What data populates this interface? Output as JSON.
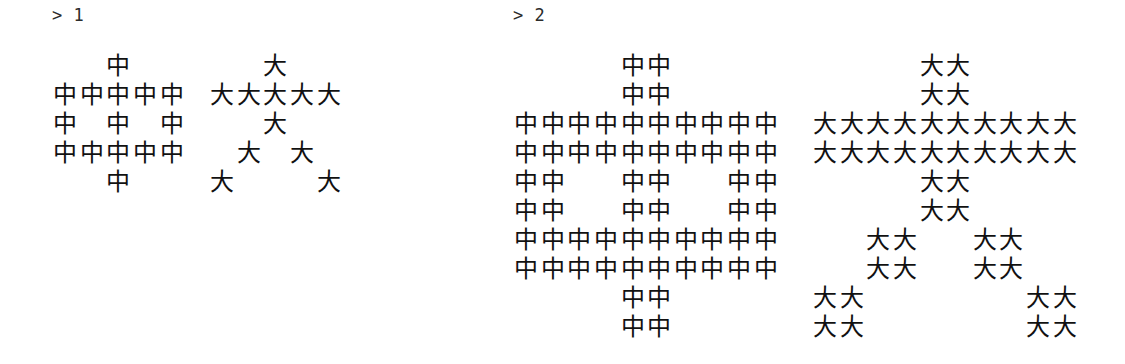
{
  "app": {
    "type": "terminal-repl-output",
    "background_color": "#ffffff",
    "text_color": "#111111",
    "prompt_color": "#2b2b2b"
  },
  "blocks": [
    {
      "id": "block-1",
      "prompt": "> 1",
      "prompt_symbol": ">",
      "input_value": "1",
      "scale": 1,
      "figures": [
        {
          "glyph": "中",
          "glyph_name": "zhong",
          "width": 5,
          "height": 5,
          "rows": [
            "..X..",
            "XXXXX",
            "X.X.X",
            "XXXXX",
            "..X.."
          ]
        },
        {
          "glyph": "大",
          "glyph_name": "da",
          "width": 5,
          "height": 5,
          "rows": [
            "..X..",
            "XXXXX",
            "..X..",
            ".X.X.",
            "X...X"
          ]
        }
      ]
    },
    {
      "id": "block-2",
      "prompt": "> 2",
      "prompt_symbol": ">",
      "input_value": "2",
      "scale": 2,
      "figures": [
        {
          "glyph": "中",
          "glyph_name": "zhong",
          "width": 10,
          "height": 10,
          "rows": [
            "....XX....",
            "....XX....",
            "XXXXXXXXXX",
            "XXXXXXXXXX",
            "XX..XX..XX",
            "XX..XX..XX",
            "XXXXXXXXXX",
            "XXXXXXXXXX",
            "....XX....",
            "....XX...."
          ]
        },
        {
          "glyph": "大",
          "glyph_name": "da",
          "width": 10,
          "height": 10,
          "rows": [
            "....XX....",
            "....XX....",
            "XXXXXXXXXX",
            "XXXXXXXXXX",
            "....XX....",
            "....XX....",
            "..XX..XX..",
            "..XX..XX..",
            "XX......XX",
            "XX......XX"
          ]
        }
      ]
    }
  ]
}
